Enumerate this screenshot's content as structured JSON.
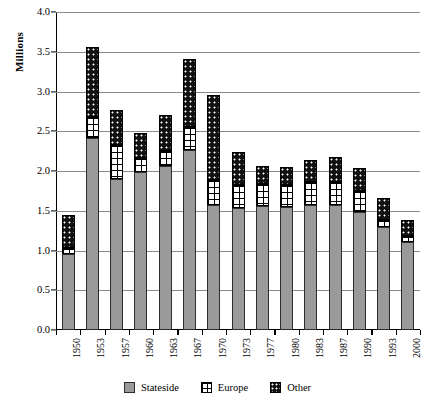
{
  "chart_data": {
    "type": "bar",
    "stacked": true,
    "title": "",
    "xlabel": "",
    "ylabel": "Millions",
    "ylim": [
      0.0,
      4.0
    ],
    "ytick_labels": [
      "0.0",
      "0.5",
      "1.0",
      "1.5",
      "2.0",
      "2.5",
      "3.0",
      "3.5",
      "4.0"
    ],
    "ytick_values": [
      0.0,
      0.5,
      1.0,
      1.5,
      2.0,
      2.5,
      3.0,
      3.5,
      4.0
    ],
    "grid": true,
    "legend_position": "bottom",
    "categories": [
      "1950",
      "1953",
      "1957",
      "1960",
      "1963",
      "1967",
      "1970",
      "1973",
      "1977",
      "1980",
      "1983",
      "1987",
      "1990",
      "1993",
      "2000"
    ],
    "series": [
      {
        "name": "Stateside",
        "color": "#9a9a9a",
        "values": [
          0.95,
          2.41,
          1.9,
          1.99,
          2.06,
          2.27,
          1.57,
          1.53,
          1.56,
          1.55,
          1.57,
          1.57,
          1.48,
          1.29,
          1.11
        ]
      },
      {
        "name": "Europe",
        "color": "#ffffff",
        "values": [
          0.08,
          0.27,
          0.43,
          0.18,
          0.19,
          0.29,
          0.32,
          0.3,
          0.28,
          0.28,
          0.29,
          0.29,
          0.27,
          0.1,
          0.07
        ]
      },
      {
        "name": "Other",
        "color": "#111111",
        "values": [
          0.42,
          0.88,
          0.44,
          0.31,
          0.46,
          0.85,
          1.06,
          0.41,
          0.22,
          0.22,
          0.28,
          0.32,
          0.29,
          0.27,
          0.21
        ]
      }
    ],
    "totals": [
      1.45,
      3.56,
      2.77,
      2.48,
      2.71,
      3.41,
      2.95,
      2.24,
      2.06,
      2.05,
      2.14,
      2.18,
      2.04,
      1.66,
      1.39
    ]
  },
  "legend": {
    "items": [
      {
        "label": "Stateside",
        "swatch": "stateside-swatch"
      },
      {
        "label": "Europe",
        "swatch": "europe-swatch"
      },
      {
        "label": "Other",
        "swatch": "other-swatch"
      }
    ]
  }
}
